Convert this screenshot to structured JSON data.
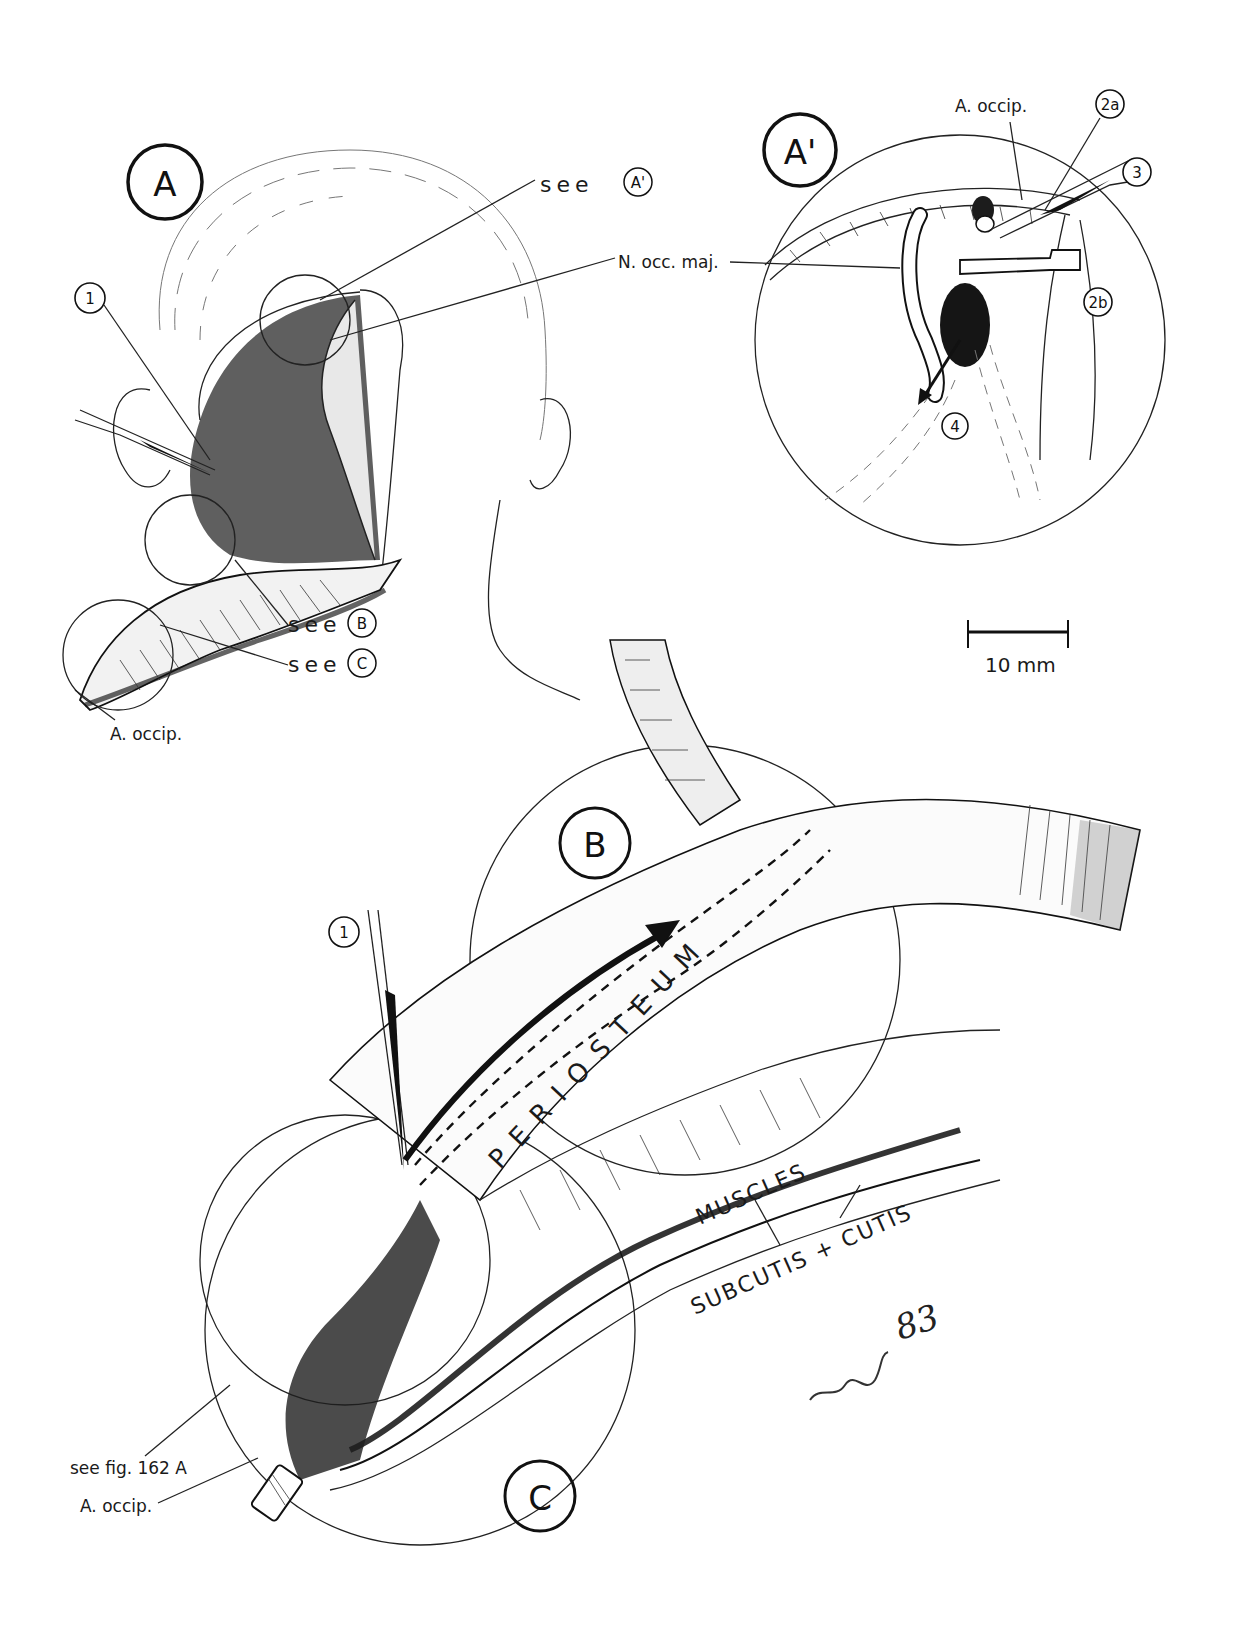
{
  "figure": {
    "panels": {
      "A": {
        "letter": "A"
      },
      "A_prime": {
        "letter": "A'"
      },
      "B": {
        "letter": "B"
      },
      "C": {
        "letter": "C"
      }
    },
    "markers": {
      "m1_top": "1",
      "m1_bottom": "1",
      "m2a": "2a",
      "m2b": "2b",
      "m3": "3",
      "m4": "4"
    },
    "labels": {
      "see_a_prime_prefix": "see",
      "see_a_prime_circle": "A'",
      "n_occ_maj": "N. occ. maj.",
      "see_b_prefix": "see",
      "see_b_circle": "B",
      "see_c_prefix": "see",
      "see_c_circle": "C",
      "a_occip_panel_a": "A. occip.",
      "a_occip_panel_a_prime": "A. occip.",
      "see_fig": "see fig. 162 A",
      "a_occip_bottom": "A. occip.",
      "periosteum": "PERIOSTEUM",
      "muscles": "MUSCLES",
      "subcutis_cutis": "SUBCUTIS + CUTIS"
    },
    "scale_bar": {
      "label": "10 mm"
    },
    "signature": {
      "text": "83"
    }
  },
  "colors": {
    "ink": "#111111",
    "paper": "#ffffff"
  }
}
